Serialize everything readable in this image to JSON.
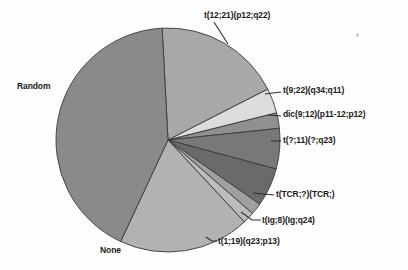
{
  "figure": {
    "background_color": "#fdfdfd",
    "outline_color": "#3a3a3a"
  },
  "chart_data": {
    "type": "pie",
    "title": "",
    "subtitle": "",
    "xlabel": "",
    "ylabel": "",
    "grid": false,
    "legend_position": "none",
    "label_placement": "outside-with-leader-lines",
    "center": {
      "x": 168,
      "y": 140
    },
    "radius": 112,
    "start_angle_deg": 357,
    "direction": "clockwise",
    "total_percent": 100,
    "categories": [
      "t(12;21)(p12;q22)",
      "t(9;22)(q34;q11)",
      "dic(9;12)(p11-12;p12)",
      "t(?;11)(?;q23)",
      "t(TCR;?)(TCR;)",
      "t(Ig;8)(Ig;q24)",
      "t(1;19)(q23;p13)",
      "None",
      "Random"
    ],
    "values": [
      18.3,
      3.6,
      2.2,
      5.8,
      5.6,
      1.7,
      1.7,
      18.9,
      42.2
    ],
    "colors": [
      "#a8a8a8",
      "#dcdcdc",
      "#909090",
      "#787878",
      "#6a6a6a",
      "#a0a0a0",
      "#bcbcbc",
      "#b2b2b2",
      "#8a8a8a"
    ],
    "slices": [
      {
        "label": "t(12;21)(p12;q22)",
        "value": 18.3,
        "color": "#a8a8a8",
        "start_angle_deg": 357,
        "end_angle_deg": 63
      },
      {
        "label": "t(9;22)(q34;q11)",
        "value": 3.6,
        "color": "#dcdcdc",
        "start_angle_deg": 63,
        "end_angle_deg": 76
      },
      {
        "label": "dic(9;12)(p11-12;p12)",
        "value": 2.2,
        "color": "#909090",
        "start_angle_deg": 76,
        "end_angle_deg": 84
      },
      {
        "label": "t(?;11)(?;q23)",
        "value": 5.8,
        "color": "#787878",
        "start_angle_deg": 84,
        "end_angle_deg": 105
      },
      {
        "label": "t(TCR;?)(TCR;)",
        "value": 5.6,
        "color": "#6a6a6a",
        "start_angle_deg": 105,
        "end_angle_deg": 125
      },
      {
        "label": "t(Ig;8)(Ig;q24)",
        "value": 1.7,
        "color": "#a0a0a0",
        "start_angle_deg": 125,
        "end_angle_deg": 131
      },
      {
        "label": "t(1;19)(q23;p13)",
        "value": 1.7,
        "color": "#bcbcbc",
        "start_angle_deg": 131,
        "end_angle_deg": 137
      },
      {
        "label": "None",
        "value": 18.9,
        "color": "#b2b2b2",
        "start_angle_deg": 137,
        "end_angle_deg": 205
      },
      {
        "label": "Random",
        "value": 42.2,
        "color": "#8a8a8a",
        "start_angle_deg": 205,
        "end_angle_deg": 357
      }
    ]
  },
  "labels": {
    "t1221": "t(12;21)(p12;q22)",
    "t922": "t(9;22)(q34;q11)",
    "dic912": "dic(9;12)(p11-12;p12)",
    "t11": "t(?;11)(?;q23)",
    "tcr": "t(TCR;?)(TCR;)",
    "ig8": "t(Ig;8)(Ig;q24)",
    "t119": "t(1;19)(q23;p13)",
    "random": "Random",
    "none": "None"
  }
}
